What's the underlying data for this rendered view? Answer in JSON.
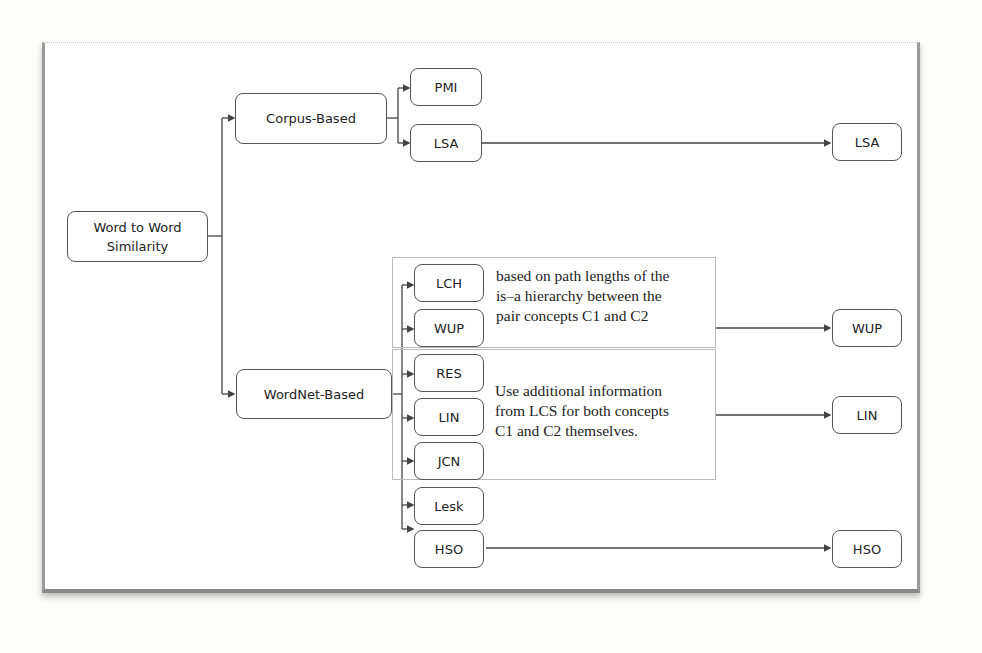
{
  "diagram": {
    "root": {
      "label": "Word to Word Similarity"
    },
    "branches": [
      {
        "label": "Corpus-Based",
        "children": [
          "PMI",
          "LSA"
        ]
      },
      {
        "label": "WordNet-Based",
        "children": [
          "LCH",
          "WUP",
          "RES",
          "LIN",
          "JCN",
          "Lesk",
          "HSO"
        ]
      }
    ],
    "groups": [
      {
        "members": [
          "LCH",
          "WUP"
        ],
        "note": "based on path lengths of the is–a hierarchy between the pair concepts C1 and C2",
        "note_lines": [
          "based on path lengths of the",
          "is–a hierarchy between the",
          "pair concepts C1 and C2"
        ],
        "output": "WUP"
      },
      {
        "members": [
          "RES",
          "LIN",
          "JCN"
        ],
        "note": "Use additional information from LCS for both concepts C1 and C2 themselves.",
        "note_lines": [
          "Use additional information",
          "from LCS for both concepts",
          "C1 and C2 themselves."
        ],
        "output": "LIN"
      }
    ],
    "outputs": [
      "LSA",
      "WUP",
      "LIN",
      "HSO"
    ],
    "nodes": {
      "root_line1": "Word to Word",
      "root_line2": "Similarity",
      "corpus": "Corpus-Based",
      "wordnet": "WordNet-Based",
      "pmi": "PMI",
      "lsa": "LSA",
      "lch": "LCH",
      "wup": "WUP",
      "res": "RES",
      "lin": "LIN",
      "jcn": "JCN",
      "lesk": "Lesk",
      "hso": "HSO",
      "out_lsa": "LSA",
      "out_wup": "WUP",
      "out_lin": "LIN",
      "out_hso": "HSO"
    },
    "colors": {
      "line": "#444444",
      "border": "#555555",
      "frame": "#9a9a9a"
    }
  }
}
